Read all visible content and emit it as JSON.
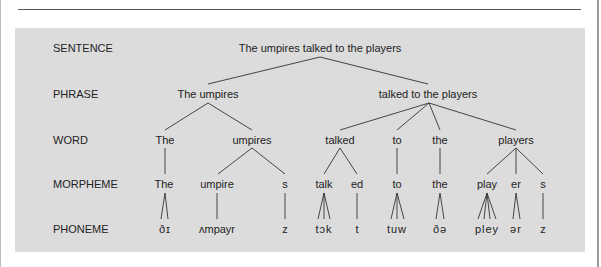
{
  "levels": {
    "sentence": "SENTENCE",
    "phrase": "PHRASE",
    "word": "WORD",
    "morpheme": "MORPHEME",
    "phoneme": "PHONEME"
  },
  "tree": {
    "sentence": "The umpires talked to the players",
    "phrases": [
      "The umpires",
      "talked to the players"
    ],
    "words": [
      "The",
      "umpires",
      "talked",
      "to",
      "the",
      "players"
    ],
    "morphemes": [
      "The",
      "umpire",
      "s",
      "talk",
      "ed",
      "to",
      "the",
      "play",
      "er",
      "s"
    ],
    "phonemes": [
      "ðɪ",
      "ʌmpayr",
      "z",
      "tɔk",
      "t",
      "tuw",
      "ðə",
      "pley",
      "ər",
      "z"
    ]
  },
  "colors": {
    "panel": "#dcdcdc",
    "text": "#222222",
    "lines": "#333333"
  }
}
